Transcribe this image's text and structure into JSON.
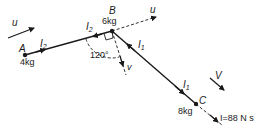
{
  "diagram": {
    "type": "mechanics-impulse",
    "particles": [
      {
        "id": "A",
        "label": "A",
        "mass": "4kg"
      },
      {
        "id": "B",
        "label": "B",
        "mass": "6kg"
      },
      {
        "id": "C",
        "label": "C",
        "mass": "8kg"
      }
    ],
    "labels": {
      "u_left": "u",
      "u_right": "u",
      "v_down": "v",
      "V_right": "V",
      "I2_ab_left": "I",
      "I2_ab_left_sub": "2",
      "I2_ab_right": "I",
      "I2_ab_right_sub": "2",
      "I1_bc_top": "I",
      "I1_bc_top_sub": "1",
      "I1_bc_bottom": "I",
      "I1_bc_bottom_sub": "1",
      "angle": "120°",
      "impulse": "I=88 N s"
    },
    "colors": {
      "ink": "#1a1a1a",
      "background": "#ffffff"
    }
  }
}
